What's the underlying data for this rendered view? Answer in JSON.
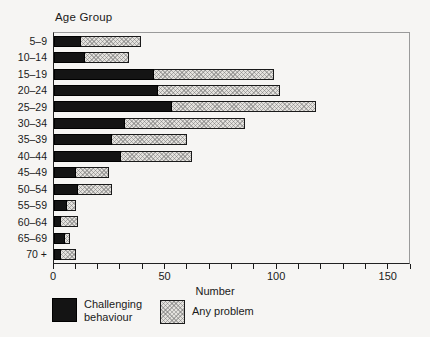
{
  "chart_data": {
    "type": "bar",
    "orientation": "horizontal",
    "title": "Age Group",
    "xlabel": "Number",
    "categories": [
      "5–9",
      "10–14",
      "15–19",
      "20–24",
      "25–29",
      "30–34",
      "35–39",
      "40–44",
      "45–49",
      "50–54",
      "55–59",
      "60–64",
      "65–69",
      "70 +"
    ],
    "series": [
      {
        "name": "Challenging behaviour",
        "values": [
          12,
          14,
          45,
          47,
          53,
          32,
          26,
          30,
          10,
          11,
          6,
          3,
          5,
          3
        ],
        "color": "#141414",
        "style": "solid"
      },
      {
        "name": "Any problem",
        "values": [
          39,
          34,
          99,
          102,
          118,
          86,
          60,
          62,
          25,
          26,
          10,
          11,
          7,
          10
        ],
        "color": "#e4e2de",
        "style": "hatched",
        "meaning": "total bar length; hatched segment drawn from Challenging value to this total"
      }
    ],
    "xlim": [
      0,
      160
    ],
    "xticks": [
      0,
      50,
      100,
      150
    ],
    "minor_tick_step": 10,
    "grid": false,
    "legend_position": "bottom-left"
  },
  "legend": {
    "items": [
      {
        "label": "Challenging behaviour",
        "swatch": "black"
      },
      {
        "label": "Any problem",
        "swatch": "hatch"
      }
    ]
  },
  "colors": {
    "challenging_bar": "#141414",
    "any_problem_bar": "#e4e2de",
    "page_background": "#f6f5f3",
    "box_border": "#9a9a9a",
    "axis": "#1a1a1a"
  }
}
